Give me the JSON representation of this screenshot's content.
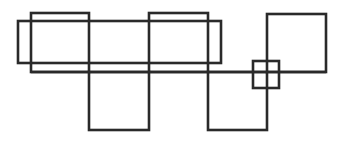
{
  "diagram": {
    "width": 341,
    "height": 142,
    "stroke_color": "#2a2a2a",
    "stroke_width": 2.6,
    "background": "#ffffff",
    "shapes": [
      {
        "name": "wide-rectangle",
        "x": 18,
        "y": 21,
        "w": 203,
        "h": 42
      },
      {
        "name": "square-top-left",
        "x": 31,
        "y": 13,
        "w": 58,
        "h": 59
      },
      {
        "name": "square-top-middle",
        "x": 149,
        "y": 13,
        "w": 59,
        "h": 59
      },
      {
        "name": "square-bottom-left",
        "x": 89,
        "y": 72,
        "w": 60,
        "h": 58
      },
      {
        "name": "square-bottom-middle",
        "x": 208,
        "y": 72,
        "w": 59,
        "h": 58
      },
      {
        "name": "square-top-right",
        "x": 267,
        "y": 14,
        "w": 59,
        "h": 58
      },
      {
        "name": "small-square",
        "x": 253,
        "y": 61,
        "w": 26,
        "h": 27
      }
    ],
    "lines": [
      {
        "name": "horizontal-baseline",
        "x1": 31,
        "y1": 72,
        "x2": 326,
        "y2": 72
      }
    ]
  }
}
